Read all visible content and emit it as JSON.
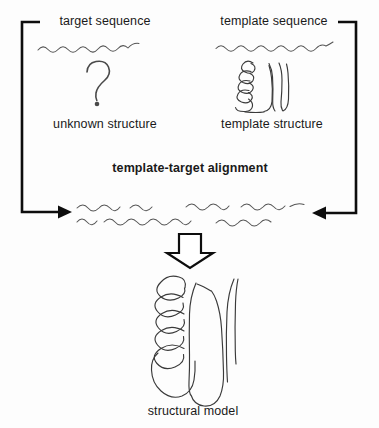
{
  "figure": {
    "title": "template-target alignment",
    "width": 379,
    "height": 428,
    "background_color": "#fdfdfd",
    "ink_color": "#3a3a3a",
    "flow_color": "#0d0d0d"
  },
  "labels": {
    "target_sequence": "target sequence",
    "template_sequence": "template sequence",
    "unknown_structure": "unknown structure",
    "template_structure": "template structure",
    "alignment": "template-target alignment",
    "structural_model": "structural model"
  },
  "icons": {
    "target_sequence_squiggle": "wavy-line-icon",
    "template_sequence_squiggle": "wavy-line-icon",
    "question_mark": "question-mark-icon",
    "template_structure_sketch": "protein-fold-sketch-icon",
    "alignment_squiggles": "aligned-sequences-icon",
    "down_block_arrow": "down-block-arrow-icon",
    "left_feedback_arrow": "left-bracket-arrow-icon",
    "right_feedback_arrow": "right-bracket-arrow-icon",
    "structural_model_sketch": "protein-fold-model-icon"
  }
}
